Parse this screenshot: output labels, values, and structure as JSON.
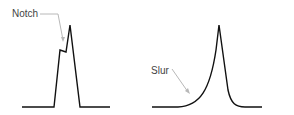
{
  "panels": [
    {
      "id": "notch",
      "label": "Notch",
      "label_pos": {
        "x": 12,
        "y": 9
      },
      "waveform_points": "22,107 54,107 60,50 66,52 70,25 80,107 110,107",
      "leader_points": "40,14 58,14 63,40"
    },
    {
      "id": "slur",
      "label": "Slur",
      "label_pos": {
        "x": 151,
        "y": 66
      },
      "waveform_path": "M 152 107 L 178 107 C 200 106, 210 90, 216 50 L 219 25 L 228 90 C 231 104, 236 107, 245 107 L 262 107",
      "leader_points": "172,69 188,92"
    }
  ],
  "colors": {
    "waveform": "#111111",
    "leader": "#b8b8b8",
    "label": "#444444"
  }
}
